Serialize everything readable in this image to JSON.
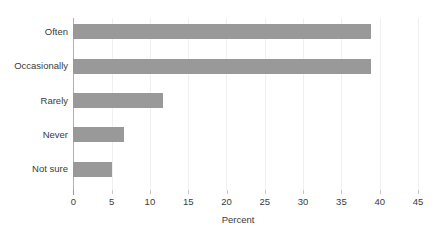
{
  "chart_data": {
    "type": "bar",
    "orientation": "horizontal",
    "title": "",
    "subtitle": "",
    "xlabel": "Percent",
    "ylabel": "",
    "categories": [
      "Often",
      "Occasionally",
      "Rarely",
      "Never",
      "Not sure"
    ],
    "values": [
      38.9,
      38.8,
      11.7,
      6.6,
      5.0
    ],
    "xlim": [
      0,
      45
    ],
    "xticks": [
      0,
      5,
      10,
      15,
      20,
      25,
      30,
      35,
      40,
      45
    ],
    "xtick_labels": [
      "0",
      "5",
      "10",
      "15",
      "20",
      "25",
      "30",
      "35",
      "40",
      "45"
    ],
    "grid": "vertical-only",
    "legend": "none",
    "bar_color": "#999999",
    "gridline_color": "#f0f0f0",
    "axis_color": "#b0b0b0",
    "text_color": "#3b3b3b",
    "background_color": "#ffffff",
    "annotations": []
  }
}
